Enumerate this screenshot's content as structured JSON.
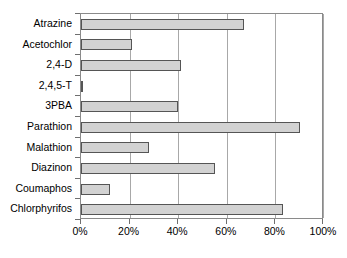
{
  "chart_data": {
    "type": "bar",
    "orientation": "horizontal",
    "title": "",
    "xlabel": "",
    "ylabel": "",
    "categories": [
      "Atrazine",
      "Acetochlor",
      "2,4-D",
      "2,4,5-T",
      "3PBA",
      "Parathion",
      "Malathion",
      "Diazinon",
      "Coumaphos",
      "Chlorphyrifos"
    ],
    "values": [
      67,
      21,
      41,
      1,
      40,
      90,
      28,
      55,
      12,
      83
    ],
    "xlim": [
      0,
      100
    ],
    "xticks": [
      0,
      20,
      40,
      60,
      80,
      100
    ],
    "xtick_labels": [
      "0%",
      "20%",
      "40%",
      "60%",
      "80%",
      "100%"
    ],
    "grid": "vertical",
    "legend": "none",
    "bar_fill_color": "#d2d2d2",
    "bar_border_color": "#555555",
    "gridline_color": "#a8a8a8",
    "axis_color": "#8a8a8a"
  }
}
